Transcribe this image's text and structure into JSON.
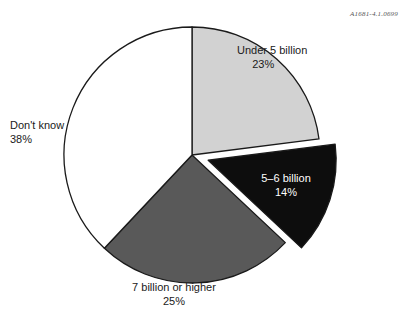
{
  "figure": {
    "reference_code": "A1681-4.1.0699"
  },
  "chart_data": {
    "type": "pie",
    "title": "",
    "subtitle": "",
    "xlabel": "",
    "ylabel": "",
    "legend_position": "none",
    "grid": false,
    "start_angle_deg": 0,
    "direction": "clockwise",
    "units": "percent",
    "total": 100,
    "categories": [
      "Under 5 billion",
      "5–6 billion",
      "7 billion or higher",
      "Don't know"
    ],
    "values": [
      23,
      14,
      25,
      38
    ],
    "slices": [
      {
        "label": "Under 5 billion",
        "percent_text": "23%",
        "value": 23,
        "color": "#d2d2d2",
        "text_color": "#1a1a1a",
        "exploded": false,
        "start_deg": 0,
        "end_deg": 82.8
      },
      {
        "label": "5–6 billion",
        "percent_text": "14%",
        "value": 14,
        "color": "#0d0d0d",
        "text_color": "#ffffff",
        "exploded": true,
        "start_deg": 82.8,
        "end_deg": 133.2
      },
      {
        "label": "7 billion or higher",
        "percent_text": "25%",
        "value": 25,
        "color": "#595959",
        "text_color": "#1a1a1a",
        "exploded": false,
        "start_deg": 133.2,
        "end_deg": 223.2
      },
      {
        "label": "Don't know",
        "percent_text": "38%",
        "value": 38,
        "color": "#ffffff",
        "text_color": "#1a1a1a",
        "exploded": false,
        "start_deg": 223.2,
        "end_deg": 360
      }
    ],
    "outline_color": "#1a1a1a"
  }
}
